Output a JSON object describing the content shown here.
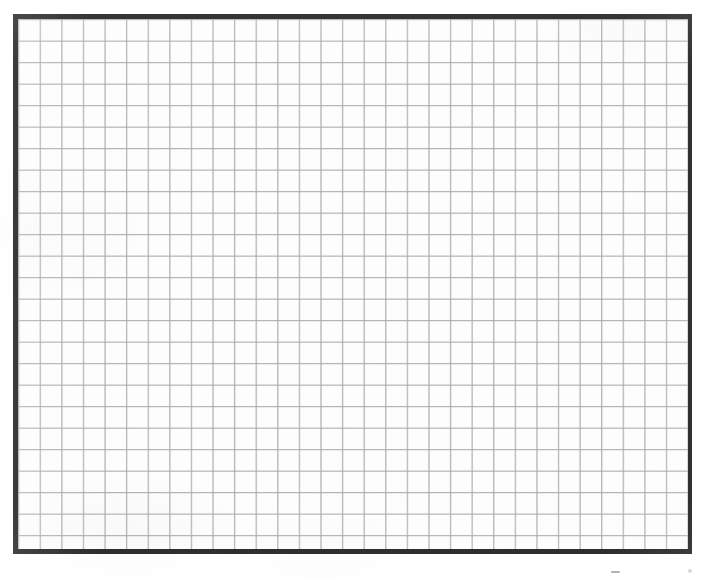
{
  "document": {
    "type": "scanned-page",
    "title": "Blank grid sheet",
    "content_text": "",
    "page_background_color": "#ffffff"
  },
  "grid": {
    "label": "ruled grid block",
    "columns": 31,
    "rows": 25,
    "cell_width_px": 21.6,
    "cell_height_px": 21.5,
    "line_color": "#bcbcbc",
    "cell_fill_color": "#fdfdfd",
    "frame": {
      "label": "grid border frame",
      "color": "#242424",
      "top_width_px": 5,
      "left_width_px": 5,
      "right_width_px": 4,
      "bottom_width_px": 5,
      "left_px": 13,
      "top_px": 14,
      "width_px": 679,
      "height_px": 540
    }
  },
  "artifacts": {
    "speck_label": "scan dust speck",
    "speck_color": "#000000"
  }
}
